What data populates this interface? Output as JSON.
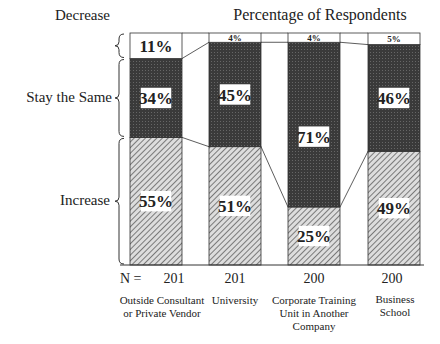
{
  "chart_data": {
    "type": "bar",
    "stacked": true,
    "normalized": true,
    "title": "Percentage of Respondents",
    "xlabel": "",
    "ylabel": "",
    "categories": [
      "Outside Consultant or Private Vendor",
      "University",
      "Corporate Training Unit in Another Company",
      "Business School"
    ],
    "n_values": [
      201,
      201,
      200,
      200
    ],
    "n_prefix": "N =",
    "series": [
      {
        "name": "Increase",
        "values": [
          55,
          51,
          25,
          49
        ],
        "pattern": "diagonal-hatch"
      },
      {
        "name": "Stay the Same",
        "values": [
          34,
          45,
          71,
          46
        ],
        "pattern": "dark-stipple"
      },
      {
        "name": "Decrease",
        "values": [
          11,
          4,
          4,
          5
        ],
        "pattern": "white"
      }
    ],
    "ylim": [
      0,
      100
    ],
    "grid": false,
    "legend": "left brace labels"
  },
  "labels": {
    "title": "Percentage of Respondents",
    "decrease": "Decrease",
    "same": "Stay the Same",
    "increase": "Increase",
    "n_prefix": "N =",
    "n1": "201",
    "n2": "201",
    "n3": "200",
    "n4": "200",
    "x1a": "Outside Consultant",
    "x1b": "or Private Vendor",
    "x2a": "University",
    "x3a": "Corporate Training",
    "x3b": "Unit in Another",
    "x3c": "Company",
    "x4a": "Business",
    "x4b": "School"
  }
}
